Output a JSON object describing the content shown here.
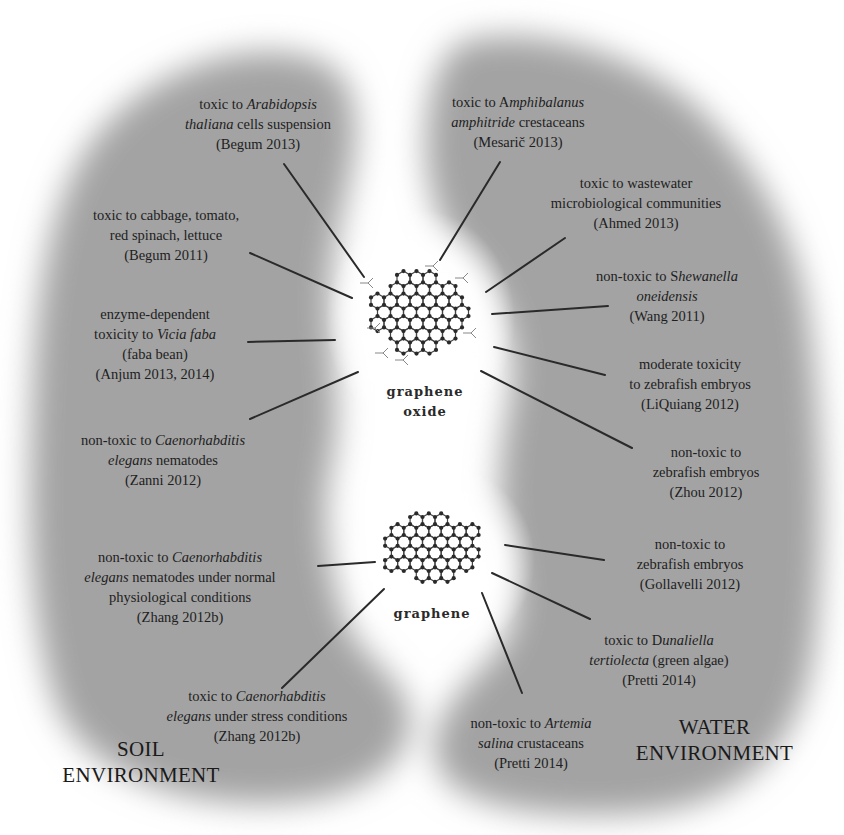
{
  "diagram": {
    "colors": {
      "region_fill": "#9e9e9e",
      "background": "#ffffff",
      "line": "#2a2a2a",
      "text": "#1e1e1e"
    },
    "environments": {
      "soil": {
        "line1": "SOIL",
        "line2": "ENVIRONMENT"
      },
      "water": {
        "line1": "WATER",
        "line2": "ENVIRONMENT"
      }
    },
    "materials": {
      "graphene_oxide": {
        "line1": "graphene",
        "line2": "oxide",
        "icon": "graphene-oxide-molecule-icon"
      },
      "graphene": {
        "line1": "graphene",
        "icon": "graphene-molecule-icon"
      }
    },
    "soil_findings": [
      {
        "id": "begum2013",
        "material": "graphene oxide",
        "lines": [
          [
            "toxic to ",
            "Arabidopsis"
          ],
          [
            "thaliana",
            " cells suspension"
          ],
          [
            "(Begum 2013)"
          ]
        ],
        "plain": "toxic to Arabidopsis thaliana cells suspension (Begum 2013)"
      },
      {
        "id": "begum2011",
        "material": "graphene oxide",
        "lines": [
          [
            "toxic to cabbage, tomato,"
          ],
          [
            "red spinach, lettuce"
          ],
          [
            "(Begum 2011)"
          ]
        ],
        "plain": "toxic to cabbage, tomato, red spinach, lettuce (Begum 2011)"
      },
      {
        "id": "anjum",
        "material": "graphene oxide",
        "lines": [
          [
            "enzyme-dependent"
          ],
          [
            "toxicity to ",
            "Vicia faba"
          ],
          [
            "(faba bean)"
          ],
          [
            "(Anjum 2013, 2014)"
          ]
        ],
        "plain": "enzyme-dependent toxicity to Vicia faba (faba bean) (Anjum 2013, 2014)"
      },
      {
        "id": "zanni2012",
        "material": "graphene oxide",
        "lines": [
          [
            "non-toxic to ",
            "Caenorhabditis"
          ],
          [
            "elegans",
            " nematodes"
          ],
          [
            "(Zanni 2012)"
          ]
        ],
        "plain": "non-toxic to Caenorhabditis elegans nematodes (Zanni 2012)"
      },
      {
        "id": "zhang2012b_normal",
        "material": "graphene",
        "lines": [
          [
            "non-toxic to ",
            "Caenorhabditis"
          ],
          [
            "elegans",
            " nematodes under normal"
          ],
          [
            "physiological conditions"
          ],
          [
            "(Zhang 2012b)"
          ]
        ],
        "plain": "non-toxic to Caenorhabditis elegans nematodes under normal physiological conditions (Zhang 2012b)"
      },
      {
        "id": "zhang2012b_stress",
        "material": "graphene",
        "lines": [
          [
            "toxic to ",
            "Caenorhabditis"
          ],
          [
            "elegans",
            " under stress conditions"
          ],
          [
            "(Zhang 2012b)"
          ]
        ],
        "plain": "toxic to Caenorhabditis elegans under stress conditions (Zhang 2012b)"
      }
    ],
    "water_findings": [
      {
        "id": "mesaric2013",
        "material": "graphene oxide",
        "lines": [
          [
            "toxic to A",
            "mphibalanus"
          ],
          [
            "amphitride",
            " crestaceans"
          ],
          [
            "(Mesarič 2013)"
          ]
        ],
        "plain": "toxic to Amphibalanus amphitride crestaceans (Mesarič 2013)"
      },
      {
        "id": "ahmed2013",
        "material": "graphene oxide",
        "lines": [
          [
            "toxic to wastewater"
          ],
          [
            "microbiological communities"
          ],
          [
            "(Ahmed 2013)"
          ]
        ],
        "plain": "toxic to wastewater microbiological communities (Ahmed 2013)"
      },
      {
        "id": "wang2011",
        "material": "graphene oxide",
        "lines": [
          [
            "non-toxic to S",
            "hewanella"
          ],
          [
            "",
            "oneidensis"
          ],
          [
            "(Wang 2011)"
          ]
        ],
        "plain": "non-toxic to Shewanella oneidensis (Wang 2011)"
      },
      {
        "id": "liquiang2012",
        "material": "graphene oxide",
        "lines": [
          [
            "moderate toxicity"
          ],
          [
            "to zebrafish embryos"
          ],
          [
            "(LiQuiang 2012)"
          ]
        ],
        "plain": "moderate toxicity to zebrafish embryos (LiQuiang 2012)"
      },
      {
        "id": "zhou2012",
        "material": "graphene oxide",
        "lines": [
          [
            "non-toxic to"
          ],
          [
            "zebrafish embryos"
          ],
          [
            "(Zhou 2012)"
          ]
        ],
        "plain": "non-toxic to zebrafish embryos (Zhou 2012)"
      },
      {
        "id": "gollavelli2012",
        "material": "graphene",
        "lines": [
          [
            "non-toxic to"
          ],
          [
            "zebrafish embryos"
          ],
          [
            "(Gollavelli 2012)"
          ]
        ],
        "plain": "non-toxic to zebrafish embryos (Gollavelli 2012)"
      },
      {
        "id": "pretti2014_dunaliella",
        "material": "graphene",
        "lines": [
          [
            "toxic to D",
            "unaliella"
          ],
          [
            "tertiolecta",
            " (green algae)"
          ],
          [
            "(Pretti 2014)"
          ]
        ],
        "plain": "toxic to Dunaliella tertiolecta (green algae) (Pretti 2014)"
      },
      {
        "id": "pretti2014_artemia",
        "material": "graphene",
        "lines": [
          [
            "non-toxic to ",
            "Artemia"
          ],
          [
            "salina",
            " crustaceans"
          ],
          [
            "(Pretti 2014)"
          ]
        ],
        "plain": "non-toxic to Artemia salina crustaceans (Pretti 2014)"
      }
    ]
  },
  "layout": {
    "labels": [
      {
        "ref": "soil_findings.0",
        "x": 258,
        "y": 94,
        "italic_first": false
      },
      {
        "ref": "soil_findings.1",
        "x": 166,
        "y": 205
      },
      {
        "ref": "soil_findings.2",
        "x": 155,
        "y": 304
      },
      {
        "ref": "soil_findings.3",
        "x": 163,
        "y": 430
      },
      {
        "ref": "soil_findings.4",
        "x": 180,
        "y": 547
      },
      {
        "ref": "soil_findings.5",
        "x": 257,
        "y": 686
      },
      {
        "ref": "water_findings.0",
        "x": 518,
        "y": 92
      },
      {
        "ref": "water_findings.1",
        "x": 636,
        "y": 173
      },
      {
        "ref": "water_findings.2",
        "x": 667,
        "y": 266
      },
      {
        "ref": "water_findings.3",
        "x": 690,
        "y": 354
      },
      {
        "ref": "water_findings.4",
        "x": 706,
        "y": 442
      },
      {
        "ref": "water_findings.5",
        "x": 690,
        "y": 534
      },
      {
        "ref": "water_findings.6",
        "x": 659,
        "y": 630
      },
      {
        "ref": "water_findings.7",
        "x": 531,
        "y": 713
      }
    ],
    "connectors": [
      {
        "x1": 284,
        "y1": 164,
        "x2": 364,
        "y2": 277
      },
      {
        "x1": 250,
        "y1": 253,
        "x2": 352,
        "y2": 298
      },
      {
        "x1": 248,
        "y1": 342,
        "x2": 335,
        "y2": 340
      },
      {
        "x1": 250,
        "y1": 419,
        "x2": 358,
        "y2": 372
      },
      {
        "x1": 318,
        "y1": 566,
        "x2": 375,
        "y2": 562
      },
      {
        "x1": 282,
        "y1": 688,
        "x2": 384,
        "y2": 589
      },
      {
        "x1": 500,
        "y1": 162,
        "x2": 440,
        "y2": 260
      },
      {
        "x1": 565,
        "y1": 238,
        "x2": 486,
        "y2": 292
      },
      {
        "x1": 608,
        "y1": 306,
        "x2": 492,
        "y2": 314
      },
      {
        "x1": 605,
        "y1": 375,
        "x2": 494,
        "y2": 347
      },
      {
        "x1": 632,
        "y1": 448,
        "x2": 481,
        "y2": 371
      },
      {
        "x1": 604,
        "y1": 560,
        "x2": 505,
        "y2": 545
      },
      {
        "x1": 590,
        "y1": 619,
        "x2": 492,
        "y2": 573
      },
      {
        "x1": 522,
        "y1": 693,
        "x2": 482,
        "y2": 593
      }
    ]
  }
}
